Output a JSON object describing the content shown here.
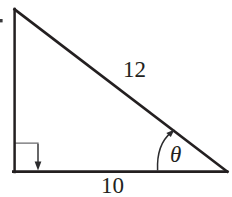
{
  "figure": {
    "type": "geometry-diagram",
    "shape": "right-triangle",
    "colors": {
      "stroke": "#231f20",
      "background": "#ffffff",
      "marker_stroke": "#59595b"
    },
    "labels": {
      "hypotenuse": "12",
      "base": "10",
      "angle": "θ"
    },
    "icons": {
      "right_angle_marker": "right-angle-square-icon",
      "right_angle_arrow": "down-arrow-icon",
      "angle_arc_arrow": "angle-arc-arrow-icon",
      "edge_dot": "dot-mark-icon"
    },
    "geometry": {
      "apex": [
        14,
        9
      ],
      "right_angle_vertex": [
        14,
        172
      ],
      "angle_vertex": [
        227,
        172
      ],
      "right_angle_square": [
        15,
        143,
        38,
        165
      ],
      "arc_start": [
        158,
        170
      ],
      "arc_end": [
        173,
        131
      ]
    }
  }
}
